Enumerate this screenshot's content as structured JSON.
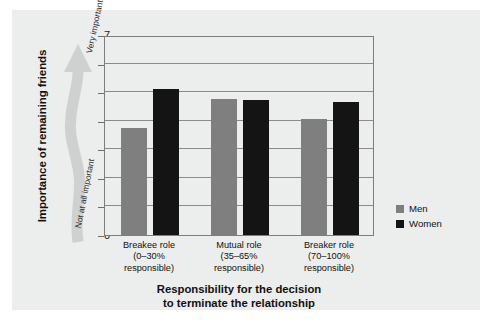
{
  "chart_data": {
    "type": "bar",
    "title": "",
    "categories": [
      "Breakee role\n(0–30%\nresponsible)",
      "Mutual role\n(35–65%\nresponsible)",
      "Breaker role\n(70–100%\nresponsible)"
    ],
    "category_lines": [
      [
        "Breakee role",
        "(0–30%",
        "responsible)"
      ],
      [
        "Mutual role",
        "(35–65%",
        "responsible)"
      ],
      [
        "Breaker role",
        "(70–100%",
        "responsible)"
      ]
    ],
    "series": [
      {
        "name": "Men",
        "color": "#7f7f7f",
        "values": [
          3.75,
          4.75,
          4.05
        ]
      },
      {
        "name": "Women",
        "color": "#141414",
        "values": [
          5.1,
          4.72,
          4.65
        ]
      }
    ],
    "xlabel": "Responsibility for the decision to terminate the relationship",
    "xlabel_lines": [
      "Responsibility for the decision",
      "to terminate the relationship"
    ],
    "ylabel": "Importance of remaining friends",
    "ylim": [
      0,
      7
    ],
    "yticks": [
      0,
      1,
      2,
      3,
      4,
      5,
      6,
      7
    ],
    "ytick_labels": [
      "0",
      "1",
      "2",
      "3",
      "4",
      "5",
      "6",
      "7"
    ],
    "grid": true,
    "grid_axis": "y",
    "legend_position": "right"
  },
  "annotation": {
    "arrow_name": "importance-arrow",
    "high_label": "Very important",
    "low_label": "Not at all important"
  },
  "legend": {
    "items": [
      {
        "label": "Men",
        "color": "#7f7f7f"
      },
      {
        "label": "Women",
        "color": "#141414"
      }
    ]
  },
  "colors": {
    "panel_background": "#eceded",
    "men": "#7f7f7f",
    "women": "#141414",
    "axis": "#7d7d7d",
    "gridline": "#8b8b8b",
    "arrow": "#cfd0d0"
  }
}
